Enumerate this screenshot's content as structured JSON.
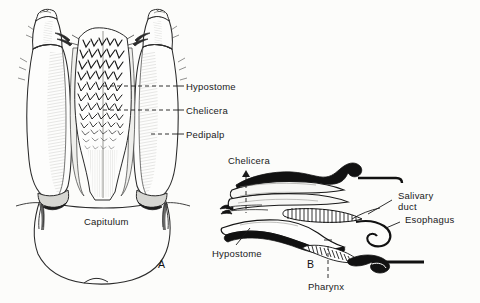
{
  "figure": {
    "background_color": "#fcfcfa",
    "ink_color": "#1a1a1a",
    "panels": [
      {
        "id": "A",
        "letter": "A",
        "view": "dorsal view of capitulum",
        "labels": [
          "Hypostome",
          "Chelicera",
          "Pedipalp",
          "Capitulum"
        ]
      },
      {
        "id": "B",
        "letter": "B",
        "view": "sagittal section of capitulum",
        "labels": [
          "Chelicera",
          "Hypostome",
          "Salivary duct",
          "Esophagus",
          "Pharynx"
        ]
      }
    ]
  },
  "panel_a": {
    "letter": "A",
    "label_hypostome": "Hypostome",
    "label_chelicera": "Chelicera",
    "label_pedipalp": "Pedipalp",
    "label_capitulum": "Capitulum"
  },
  "panel_b": {
    "letter": "B",
    "label_chelicera": "Chelicera",
    "label_hypostome": "Hypostome",
    "label_salivary_duct_line1": "Salivary",
    "label_salivary_duct_line2": "duct",
    "label_esophagus": "Esophagus",
    "label_pharynx": "Pharynx"
  }
}
